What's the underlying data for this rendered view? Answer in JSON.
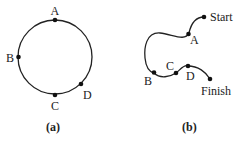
{
  "figure_a": {
    "caption": "(a)",
    "points": {
      "A": "A",
      "B": "B",
      "C": "C",
      "D": "D"
    }
  },
  "figure_b": {
    "caption": "(b)",
    "points": {
      "A": "A",
      "B": "B",
      "C": "C",
      "D": "D"
    },
    "start_label": "Start",
    "finish_label": "Finish"
  },
  "colors": {
    "stroke": "#222222",
    "background": "#ffffff"
  }
}
